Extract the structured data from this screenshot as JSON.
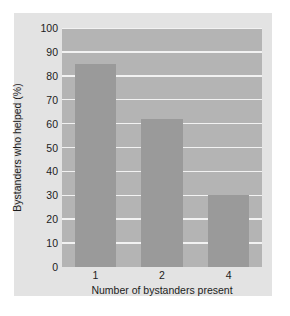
{
  "chart_data": {
    "type": "bar",
    "title": "",
    "xlabel": "Number of bystanders present",
    "ylabel": "Bystanders who helped (%)",
    "categories": [
      "1",
      "2",
      "4"
    ],
    "values": [
      85,
      62,
      30
    ],
    "ylim": [
      0,
      100
    ],
    "yticks": [
      0,
      10,
      20,
      30,
      40,
      50,
      60,
      70,
      80,
      90,
      100
    ],
    "ytick_labels": [
      "0",
      "10",
      "20",
      "30",
      "40",
      "50",
      "60",
      "70",
      "80",
      "90",
      "100"
    ],
    "grid": true,
    "legend": false,
    "colors": {
      "bar": "#9a9a9a",
      "plot_background": "#b4b4b4",
      "gridline": "#f2f2f2",
      "card_background": "#e3e3e3",
      "figure_background": "#ffffff",
      "text": "#1c1c1c"
    }
  }
}
